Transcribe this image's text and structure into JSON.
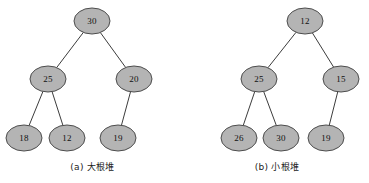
{
  "figure": {
    "title": "",
    "background_color": "#ffffff",
    "node_fill_color": "#b4b4b4",
    "node_stroke_color": "#4d4d4d",
    "edge_color": "#3c3c3c",
    "label_color": "#111111",
    "node_rx": 18,
    "node_ry": 13
  },
  "panels": [
    {
      "id": "panel-a",
      "caption": "(a) 大根堆",
      "heap_type": "max-heap",
      "nodes": [
        {
          "id": "a-30",
          "value": "30",
          "cx": 92,
          "cy": 21
        },
        {
          "id": "a-25",
          "value": "25",
          "cx": 48,
          "cy": 79
        },
        {
          "id": "a-20",
          "value": "20",
          "cx": 134,
          "cy": 79
        },
        {
          "id": "a-18",
          "value": "18",
          "cx": 24,
          "cy": 138
        },
        {
          "id": "a-12",
          "value": "12",
          "cx": 67,
          "cy": 138
        },
        {
          "id": "a-19",
          "value": "19",
          "cx": 118,
          "cy": 138
        }
      ],
      "edges": [
        {
          "from": "a-30",
          "to": "a-25"
        },
        {
          "from": "a-30",
          "to": "a-20"
        },
        {
          "from": "a-25",
          "to": "a-18"
        },
        {
          "from": "a-25",
          "to": "a-12"
        },
        {
          "from": "a-20",
          "to": "a-19"
        }
      ]
    },
    {
      "id": "panel-b",
      "caption": "(b) 小根堆",
      "heap_type": "min-heap",
      "nodes": [
        {
          "id": "b-12",
          "value": "12",
          "cx": 305,
          "cy": 21
        },
        {
          "id": "b-25",
          "value": "25",
          "cx": 259,
          "cy": 79
        },
        {
          "id": "b-15",
          "value": "15",
          "cx": 341,
          "cy": 79
        },
        {
          "id": "b-26",
          "value": "26",
          "cx": 239,
          "cy": 138
        },
        {
          "id": "b-30",
          "value": "30",
          "cx": 281,
          "cy": 138
        },
        {
          "id": "b-19",
          "value": "19",
          "cx": 326,
          "cy": 138
        }
      ],
      "edges": [
        {
          "from": "b-12",
          "to": "b-25"
        },
        {
          "from": "b-12",
          "to": "b-15"
        },
        {
          "from": "b-25",
          "to": "b-26"
        },
        {
          "from": "b-25",
          "to": "b-30"
        },
        {
          "from": "b-15",
          "to": "b-19"
        }
      ]
    }
  ]
}
